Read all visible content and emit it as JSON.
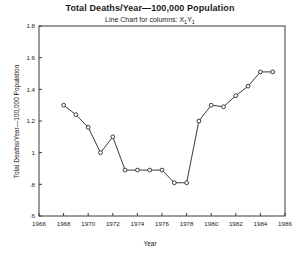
{
  "chart_data": {
    "type": "line",
    "title": "Total Deaths/Year—100,000 Population",
    "subtitle": "Line Chart for columns: X₁Y₁",
    "xlabel": "Year",
    "ylabel": "Total Deaths/Year—100,000 Population",
    "xlim": [
      1966,
      1986
    ],
    "ylim": [
      0.6,
      1.8
    ],
    "grid": false,
    "legend": "none",
    "marker": "open-circle",
    "line_color": "#3a3a3a",
    "xticks": [
      1966,
      1968,
      1970,
      1972,
      1974,
      1976,
      1978,
      1980,
      1982,
      1984,
      1986
    ],
    "xtick_labels": [
      "1966",
      "1968",
      "1970",
      "1972",
      "1974",
      "1976",
      "1978",
      "1980",
      "1982",
      "1984",
      "1986"
    ],
    "yticks": [
      0.6,
      0.8,
      1.0,
      1.2,
      1.4,
      1.6,
      1.8
    ],
    "ytick_labels": [
      ".6",
      ".8",
      "1",
      "1.2",
      "1.4",
      "1.6",
      "1.8"
    ],
    "x": [
      1968,
      1969,
      1970,
      1971,
      1972,
      1973,
      1974,
      1975,
      1976,
      1977,
      1978,
      1979,
      1980,
      1981,
      1982,
      1983,
      1984,
      1985
    ],
    "values": [
      1.3,
      1.24,
      1.16,
      1.0,
      1.1,
      0.89,
      0.89,
      0.89,
      0.89,
      0.81,
      0.81,
      1.2,
      1.3,
      1.29,
      1.36,
      1.42,
      1.51,
      1.51
    ],
    "series": [
      {
        "name": "X₁Y₁",
        "x": [
          1968,
          1969,
          1970,
          1971,
          1972,
          1973,
          1974,
          1975,
          1976,
          1977,
          1978,
          1979,
          1980,
          1981,
          1982,
          1983,
          1984,
          1985
        ],
        "values": [
          1.3,
          1.24,
          1.16,
          1.0,
          1.1,
          0.89,
          0.89,
          0.89,
          0.89,
          0.81,
          0.81,
          1.2,
          1.3,
          1.29,
          1.36,
          1.42,
          1.51,
          1.51
        ]
      }
    ]
  }
}
